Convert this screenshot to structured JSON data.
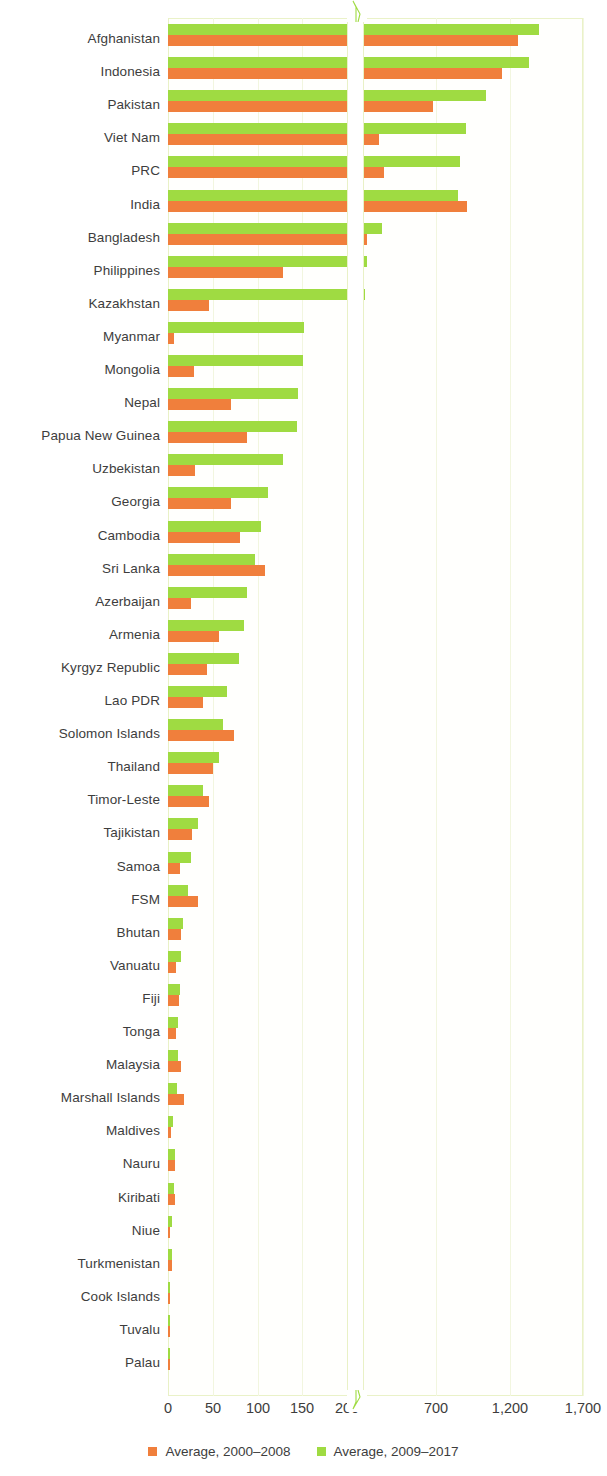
{
  "chart_data": {
    "type": "bar",
    "title": "",
    "xlabel": "",
    "ylabel": "",
    "orientation": "horizontal",
    "axis_break": {
      "present": true,
      "after": 200,
      "resume": 200
    },
    "xticks": [
      {
        "label": "0",
        "value": 0
      },
      {
        "label": "50",
        "value": 50
      },
      {
        "label": "100",
        "value": 100
      },
      {
        "label": "150",
        "value": 150
      },
      {
        "label": "200",
        "value": 200
      },
      {
        "label": "700",
        "value": 700
      },
      {
        "label": "1,200",
        "value": 1200
      },
      {
        "label": "1,700",
        "value": 1700
      }
    ],
    "xlim": [
      0,
      1700
    ],
    "grid": true,
    "legend_position": "bottom",
    "colors": {
      "series_1": "#f07f3c",
      "series_2": "#9fdb42"
    },
    "series": [
      {
        "name": "Average, 2000–2008",
        "color": "#f07f3c"
      },
      {
        "name": "Average, 2009–2017",
        "color": "#9fdb42"
      }
    ],
    "categories": [
      "Afghanistan",
      "Indonesia",
      "Pakistan",
      "Viet Nam",
      "PRC",
      "India",
      "Bangladesh",
      "Philippines",
      "Kazakhstan",
      "Myanmar",
      "Mongolia",
      "Nepal",
      "Papua New Guinea",
      "Uzbekistan",
      "Georgia",
      "Cambodia",
      "Sri Lanka",
      "Azerbaijan",
      "Armenia",
      "Kyrgyz Republic",
      "Lao PDR",
      "Solomon Islands",
      "Thailand",
      "Timor-Leste",
      "Tajikistan",
      "Samoa",
      "FSM",
      "Bhutan",
      "Vanuatu",
      "Fiji",
      "Tonga",
      "Malaysia",
      "Marshall Islands",
      "Maldives",
      "Nauru",
      "Kiribati",
      "Niue",
      "Turkmenistan",
      "Cook Islands",
      "Tuvalu",
      "Palau"
    ],
    "values_2000_2008": [
      1260,
      1150,
      680,
      310,
      340,
      910,
      230,
      128,
      46,
      7,
      29,
      70,
      88,
      30,
      70,
      80,
      108,
      26,
      57,
      44,
      39,
      74,
      50,
      46,
      27,
      13,
      33,
      14,
      9,
      12,
      9,
      15,
      18,
      3,
      8,
      8,
      0.5,
      4,
      0.6,
      1.5,
      0.3
    ],
    "values_2009_2017": [
      1400,
      1330,
      1040,
      900,
      860,
      850,
      330,
      225,
      215,
      152,
      151,
      145,
      144,
      128,
      112,
      104,
      97,
      88,
      85,
      79,
      66,
      61,
      57,
      39,
      33,
      26,
      22,
      17,
      14,
      13,
      11,
      11,
      10,
      6,
      8,
      7,
      4,
      5,
      2,
      2,
      1.5
    ]
  },
  "legend": {
    "items": [
      {
        "label": "Average, 2000–2008",
        "color": "#f07f3c"
      },
      {
        "label": "Average, 2009–2017",
        "color": "#9fdb42"
      }
    ]
  }
}
